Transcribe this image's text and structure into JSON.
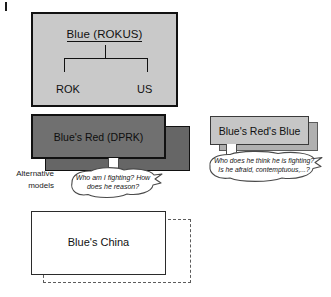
{
  "diagram": {
    "title_boxes": {
      "rokus": {
        "label": "Blue (ROKUS)",
        "children": [
          "ROK",
          "US"
        ],
        "fill": "#c9c9c9",
        "border": "#111111"
      },
      "dprk": {
        "label": "Blue's Red (DPRK)",
        "fill": "#707070",
        "shadow_fill": "#666666"
      },
      "reds_blue": {
        "label": "Blue's Red's Blue",
        "fill": "#c6c6c6",
        "shadow_fill": "#b0b0b0"
      },
      "china": {
        "label": "Blue's China",
        "fill": "#ffffff",
        "border": "#2b2b2b",
        "dashed_border": "#5c5c5c"
      }
    },
    "thought_bubbles": {
      "dprk": {
        "line1": "Who am I fighting? How",
        "line2": "does he reason?"
      },
      "reds_blue": {
        "line1": "Who does he think he is fighting?",
        "line2": "Is he afraid, contemptuous,...?"
      }
    },
    "annotations": {
      "alternative_models": {
        "line1": "Alternative",
        "line2": "models"
      }
    }
  }
}
